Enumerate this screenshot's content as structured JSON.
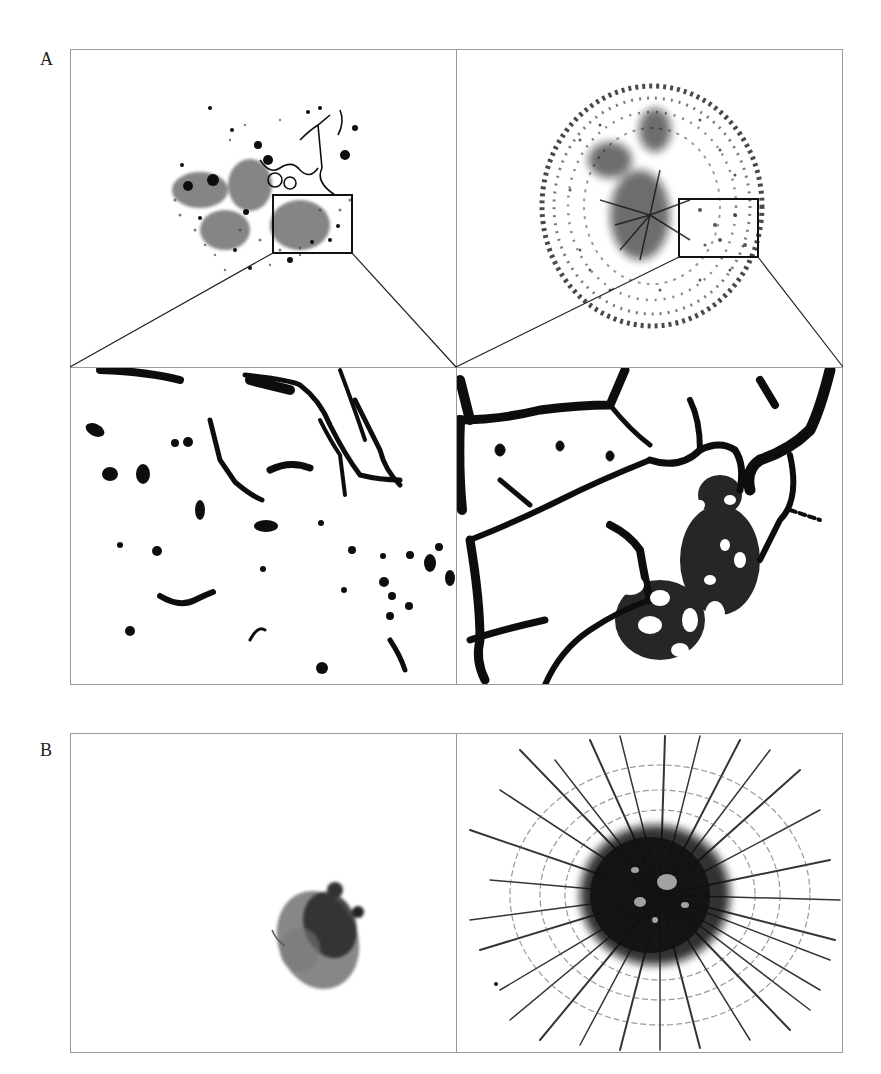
{
  "figure": {
    "panels": [
      {
        "label": "A",
        "layout": "2x2 grid; top row overview images with inset boxes, bottom row magnified insets",
        "subpanels": [
          {
            "position": "top-left",
            "content": "sparse irregular cell cluster with scattered dots; inset box marked"
          },
          {
            "position": "top-right",
            "content": "circular dense vascular-like network; inset box marked"
          },
          {
            "position": "bottom-left",
            "content": "magnified inset of top-left: isolated dots and thin branching strands"
          },
          {
            "position": "bottom-right",
            "content": "magnified inset of top-right: interconnected thick tubular network"
          }
        ]
      },
      {
        "label": "B",
        "layout": "1x2 grid",
        "subpanels": [
          {
            "position": "left",
            "content": "compact dark spheroid, no sprouting"
          },
          {
            "position": "right",
            "content": "spheroid with extensive radial sprouting network"
          }
        ]
      }
    ]
  },
  "colors": {
    "frame": "#9a9a9a",
    "ink": "#111111",
    "background": "#ffffff"
  }
}
